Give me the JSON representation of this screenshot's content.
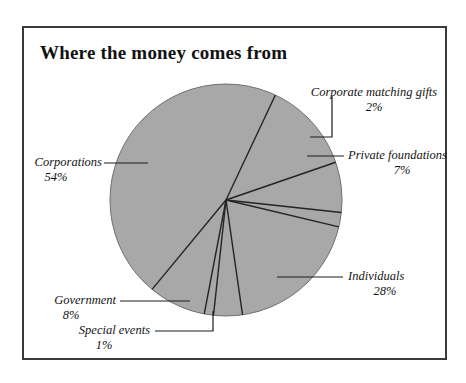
{
  "figure": {
    "title": "Where the money comes from",
    "frame_color": "#3a3a3a",
    "background": "#ffffff"
  },
  "chart_data": {
    "type": "pie",
    "title": "Where the money comes from",
    "xlabel": "",
    "ylabel": "",
    "slice_fill_color": "#a8a8a8",
    "slice_edge_color": "#242424",
    "legend_position": "callout-labels",
    "grid": false,
    "units": "percent",
    "total": 100,
    "categories": [
      "Corporations",
      "Individuals",
      "Government",
      "Private foundations",
      "Corporate matching gifts",
      "Special events"
    ],
    "values": [
      54,
      28,
      8,
      7,
      2,
      1
    ],
    "slices": [
      {
        "name": "Corporations",
        "label": "Corporations",
        "percent": 54,
        "percent_text": "54%",
        "start_angle_deg": 100.8,
        "end_angle_deg": 295.2
      },
      {
        "name": "Individuals",
        "label": "Individuals",
        "percent": 28,
        "percent_text": "28%",
        "start_angle_deg": -19.0,
        "end_angle_deg": 81.8
      },
      {
        "name": "Government",
        "label": "Government",
        "percent": 8,
        "percent_text": "8%",
        "start_angle_deg": 100.8,
        "end_angle_deg": 129.6
      },
      {
        "name": "Private foundations",
        "label": "Private foundations",
        "percent": 7,
        "percent_text": "7%",
        "start_angle_deg": -19.0,
        "end_angle_deg": 6.2
      },
      {
        "name": "Corporate matching gifts",
        "label": "Corporate matching gifts",
        "percent": 2,
        "percent_text": "2%",
        "start_angle_deg": 6.2,
        "end_angle_deg": 13.4
      },
      {
        "name": "Special events",
        "label": "Special events",
        "percent": 1,
        "percent_text": "1%",
        "start_angle_deg": 96.2,
        "end_angle_deg": 100.8
      }
    ]
  },
  "labels": {
    "corporations": {
      "name": "Corporations",
      "percent_text": "54%"
    },
    "individuals": {
      "name": "Individuals",
      "percent_text": "28%"
    },
    "government": {
      "name": "Government",
      "percent_text": "8%"
    },
    "private_foundations": {
      "name": "Private foundations",
      "percent_text": "7%"
    },
    "corporate_matching_gifts": {
      "name": "Corporate matching gifts",
      "percent_text": "2%"
    },
    "special_events": {
      "name": "Special events",
      "percent_text": "1%"
    }
  }
}
